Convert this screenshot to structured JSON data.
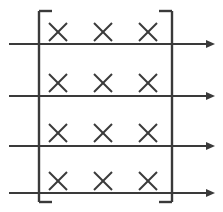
{
  "canvas": {
    "width": 223,
    "height": 212,
    "background": "#ffffff"
  },
  "figure": {
    "title": "",
    "stroke_color": "#3a3a3a",
    "line_width": 2.1
  },
  "bracket": {
    "name": "big-square-bracket",
    "left_x": 39,
    "right_x": 172,
    "top_y": 11,
    "bottom_y": 202,
    "arm_length": 13,
    "stroke_color": "#3a3a3a",
    "line_width": 2.4
  },
  "arrows": [
    {
      "label": "arrow-1",
      "y": 44,
      "x_start": 9,
      "x_end": 215
    },
    {
      "label": "arrow-2",
      "y": 96,
      "x_start": 9,
      "x_end": 215
    },
    {
      "label": "arrow-3",
      "y": 146,
      "x_start": 9,
      "x_end": 215
    },
    {
      "label": "arrow-4",
      "y": 193,
      "x_start": 9,
      "x_end": 215
    }
  ],
  "arrowhead": {
    "length": 9,
    "half_width": 4
  },
  "x_marks": {
    "glyph": "×",
    "columns_x": [
      58,
      103,
      148
    ],
    "rows_y": [
      32,
      83,
      133,
      181
    ],
    "arm_half": 9,
    "stroke_color": "#3a3a3a",
    "line_width": 2.0,
    "count": 12,
    "rows": [
      {
        "row": 1,
        "marks": [
          "x",
          "x",
          "x"
        ]
      },
      {
        "row": 2,
        "marks": [
          "x",
          "x",
          "x"
        ]
      },
      {
        "row": 3,
        "marks": [
          "x",
          "x",
          "x"
        ]
      },
      {
        "row": 4,
        "marks": [
          "x",
          "x",
          "x"
        ]
      }
    ]
  }
}
